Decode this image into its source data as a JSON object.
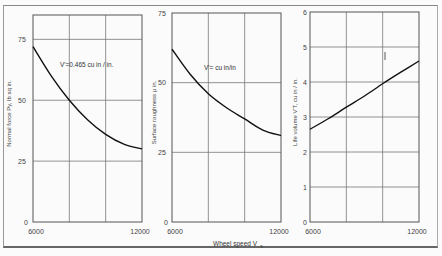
{
  "figure": {
    "shared_xlabel": "Wheel speed V",
    "shared_xlabel_sub": "s"
  },
  "chart_data": [
    {
      "type": "line",
      "title": "",
      "xlabel": "Wheel speed Vs",
      "ylabel": "Normal force Py, lb sq in.",
      "annotation": "V'=0.465 cu in / in.",
      "x": [
        6000,
        7000,
        8000,
        9000,
        10000,
        11000,
        12000
      ],
      "series": [
        {
          "name": "Normal force",
          "values": [
            72,
            60,
            50,
            42,
            36,
            32,
            30
          ]
        }
      ],
      "xlim": [
        6000,
        12000
      ],
      "ylim": [
        0,
        85
      ],
      "xticks": [
        "6000",
        "12000"
      ],
      "yticks": [
        "0",
        "25",
        "50",
        "75"
      ],
      "grid": true
    },
    {
      "type": "line",
      "title": "",
      "xlabel": "Wheel speed Vs",
      "ylabel": "Surface roughness μ in.",
      "annotation": "V'= cu in/in",
      "x": [
        6000,
        7000,
        8000,
        9000,
        10000,
        11000,
        12000
      ],
      "series": [
        {
          "name": "Surface roughness",
          "values": [
            62,
            53,
            46,
            41,
            37,
            33,
            31
          ]
        }
      ],
      "xlim": [
        6000,
        12000
      ],
      "ylim": [
        0,
        75
      ],
      "xticks": [
        "6000",
        "12000"
      ],
      "yticks": [
        "0",
        "25",
        "50",
        "75"
      ],
      "grid": true
    },
    {
      "type": "line",
      "title": "",
      "xlabel": "Wheel speed Vs",
      "ylabel": "Life volume V'T, cu in / in.",
      "annotation": "",
      "x": [
        6000,
        7000,
        8000,
        9000,
        10000,
        11000,
        12000
      ],
      "series": [
        {
          "name": "Life volume",
          "values": [
            2.65,
            2.95,
            3.28,
            3.6,
            3.95,
            4.28,
            4.6
          ]
        }
      ],
      "xlim": [
        6000,
        12000
      ],
      "ylim": [
        0,
        6
      ],
      "xticks": [
        "6000",
        "12000"
      ],
      "yticks": [
        "0",
        "1",
        "2",
        "3",
        "4",
        "5",
        "6"
      ],
      "grid": true
    }
  ]
}
